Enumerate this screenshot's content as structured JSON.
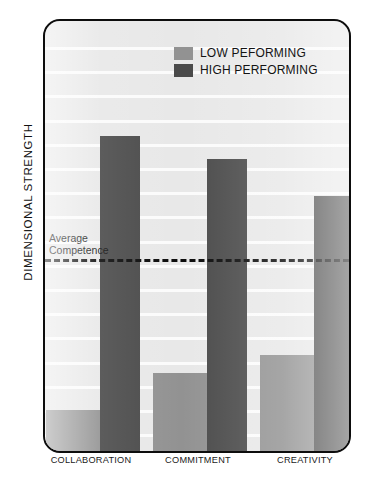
{
  "chart_data": {
    "type": "bar",
    "title": "",
    "xlabel": "",
    "ylabel": "DIMENSIONAL STRENGTH",
    "categories": [
      "COLLABORATION",
      "COMMITMENT",
      "CREATIVITY"
    ],
    "series": [
      {
        "name": "LOW PEFORMING",
        "color": "#929292",
        "values": [
          11,
          21,
          26
        ]
      },
      {
        "name": "HIGH PERFORMING",
        "color": "#4a4a4a",
        "values": [
          85,
          79,
          69
        ]
      }
    ],
    "ylim": [
      0,
      100
    ],
    "grid": true,
    "gridline_count": 17,
    "legend_position": "top-center",
    "annotations": [
      {
        "name": "average-competence",
        "label": "Average\nCompetence",
        "type": "threshold-line",
        "value": 53,
        "style": "dashed"
      }
    ]
  },
  "legend": {
    "entries": [
      {
        "label": "LOW PEFORMING",
        "swatch_color": "#929292"
      },
      {
        "label": "HIGH PERFORMING",
        "swatch_color": "#4a4a4a"
      }
    ]
  },
  "axis": {
    "y_title": "DIMENSIONAL STRENGTH"
  },
  "annotation": {
    "average_competence": "Average\nCompetence"
  },
  "colors": {
    "low_performing": "#929292",
    "high_performing": "#4a4a4a",
    "panel_background": "#e8e8e8",
    "gridline": "#fbfbfb",
    "border": "#0d0d0d"
  }
}
